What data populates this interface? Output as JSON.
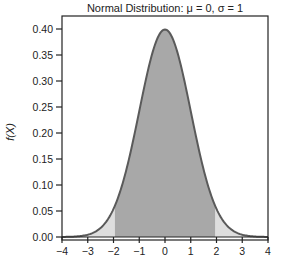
{
  "chart_data": {
    "type": "area",
    "title": "Normal Distribution: μ = 0, σ = 1",
    "xlabel": "",
    "ylabel": "f(X)",
    "xlim": [
      -4,
      4
    ],
    "ylim": [
      0,
      0.4
    ],
    "x_ticks": [
      -4,
      -3,
      -2,
      -1,
      0,
      1,
      2,
      3,
      4
    ],
    "x_tick_labels": [
      "−4",
      "−3",
      "−2",
      "−1",
      "0",
      "1",
      "2",
      "3",
      "4"
    ],
    "y_ticks": [
      0.0,
      0.05,
      0.1,
      0.15,
      0.2,
      0.25,
      0.3,
      0.35,
      0.4
    ],
    "y_tick_labels": [
      "0.00",
      "0.05",
      "0.10",
      "0.15",
      "0.20",
      "0.25",
      "0.30",
      "0.35",
      "0.40"
    ],
    "grid": false,
    "legend": null,
    "distribution": {
      "name": "normal",
      "mean": 0,
      "sd": 1
    },
    "series": [
      {
        "name": "density",
        "x": [
          -4,
          -3.5,
          -3,
          -2.5,
          -2,
          -1.96,
          -1.5,
          -1,
          -0.5,
          0,
          0.5,
          1,
          1.5,
          1.96,
          2,
          2.5,
          3,
          3.5,
          4
        ],
        "values": [
          0.0001,
          0.0009,
          0.0044,
          0.0175,
          0.054,
          0.0584,
          0.1295,
          0.242,
          0.3521,
          0.3989,
          0.3521,
          0.242,
          0.1295,
          0.0584,
          0.054,
          0.0175,
          0.0044,
          0.0009,
          0.0001
        ]
      }
    ],
    "shaded_regions": [
      {
        "name": "central-region",
        "from": -1.96,
        "to": 1.96,
        "color": "#a8a8a8"
      },
      {
        "name": "left-tail",
        "from": -4,
        "to": -1.96,
        "color": "#dedede"
      },
      {
        "name": "right-tail",
        "from": 1.96,
        "to": 4,
        "color": "#dedede"
      }
    ],
    "colors": {
      "curve": "#5a5a5a",
      "axis": "#222222"
    }
  }
}
